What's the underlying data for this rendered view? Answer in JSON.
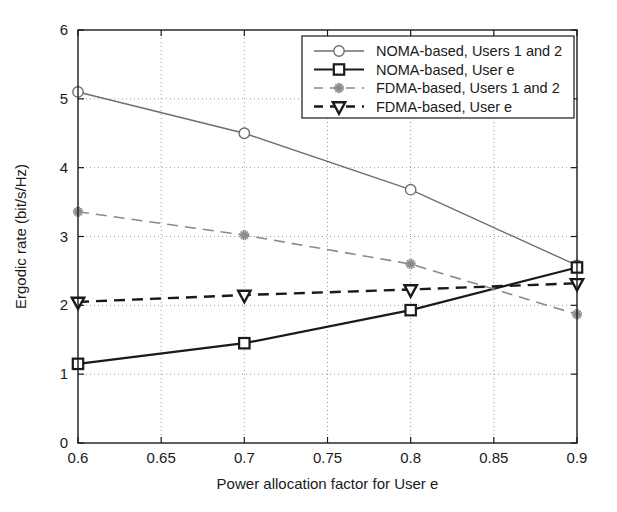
{
  "chart_data": {
    "type": "line",
    "title": "",
    "xlabel": "Power allocation factor for User e",
    "ylabel": "Ergodic rate (bit/s/Hz)",
    "xlim": [
      0.6,
      0.9
    ],
    "ylim": [
      0,
      6
    ],
    "xticks": [
      0.6,
      0.65,
      0.7,
      0.75,
      0.8,
      0.85,
      0.9
    ],
    "xtick_labels": [
      "0.6",
      "0.65",
      "0.7",
      "0.75",
      "0.8",
      "0.85",
      "0.9"
    ],
    "yticks": [
      0,
      1,
      2,
      3,
      4,
      5,
      6
    ],
    "ytick_labels": [
      "0",
      "1",
      "2",
      "3",
      "4",
      "5",
      "6"
    ],
    "grid": true,
    "grid_style": "dotted",
    "legend_position": "top-right",
    "x": [
      0.6,
      0.7,
      0.8,
      0.9
    ],
    "series": [
      {
        "name": "NOMA-based, Users 1 and 2",
        "values": [
          5.1,
          4.5,
          3.68,
          2.58
        ],
        "marker": "circle",
        "line_style": "solid",
        "color": "#6e6e6e",
        "line_width": 1.4
      },
      {
        "name": "NOMA-based, User e",
        "values": [
          1.15,
          1.45,
          1.93,
          2.55
        ],
        "marker": "square",
        "line_style": "solid",
        "color": "#1a1a1a",
        "line_width": 2.2
      },
      {
        "name": "FDMA-based, Users 1 and 2",
        "values": [
          3.36,
          3.02,
          2.6,
          1.87
        ],
        "marker": "star",
        "line_style": "dashed",
        "color": "#8a8a8a",
        "line_width": 1.6
      },
      {
        "name": "FDMA-based, User e",
        "values": [
          2.05,
          2.15,
          2.23,
          2.32
        ],
        "marker": "triangle-down",
        "line_style": "dashed",
        "color": "#1a1a1a",
        "line_width": 2.4
      }
    ]
  },
  "legend": {
    "entries": [
      {
        "label": "NOMA-based, Users 1 and 2"
      },
      {
        "label": "NOMA-based, User e"
      },
      {
        "label": "FDMA-based, Users 1 and 2"
      },
      {
        "label": "FDMA-based, User e"
      }
    ]
  },
  "colors": {
    "axis": "#1a1a1a",
    "grid": "#9a9a9a",
    "background": "#ffffff",
    "noma_users": "#6e6e6e",
    "noma_e": "#1a1a1a",
    "fdma_users": "#8a8a8a",
    "fdma_e": "#1a1a1a"
  }
}
